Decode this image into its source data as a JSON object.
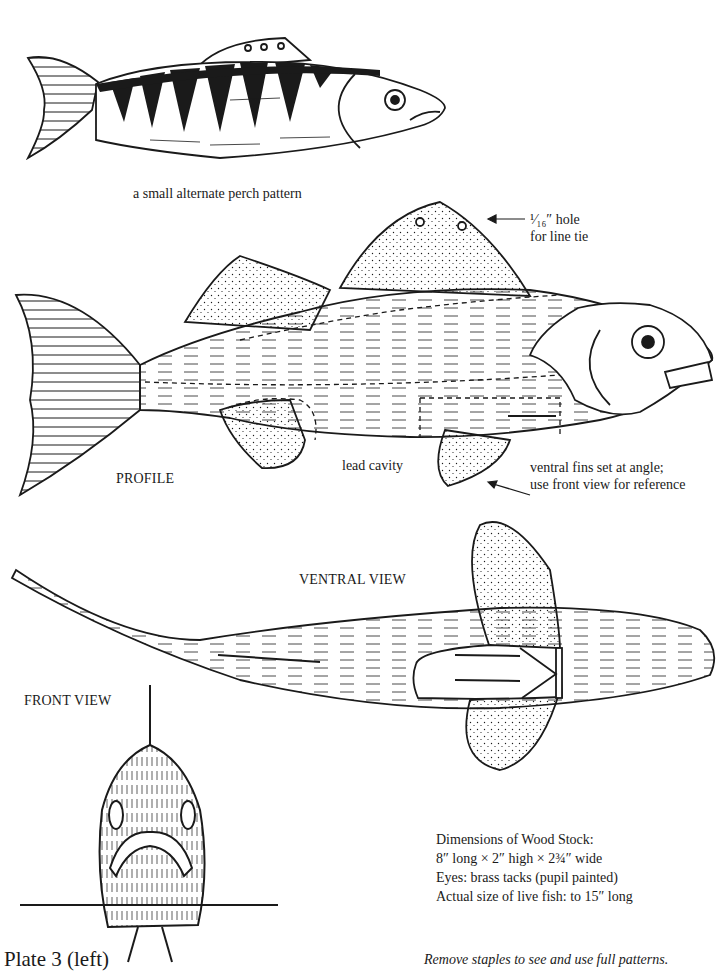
{
  "captions": {
    "alternate_pattern": "a small alternate perch pattern",
    "hole_line1": "¹⁄₁₆″ hole",
    "hole_line2": "for line tie",
    "profile": "PROFILE",
    "lead_cavity": "lead cavity",
    "ventral_fins_line1": "ventral fins set at angle;",
    "ventral_fins_line2": "use front view for reference",
    "ventral_view": "VENTRAL VIEW",
    "front_view": "FRONT VIEW"
  },
  "dimensions": {
    "heading": "Dimensions of Wood Stock:",
    "size": "8″ long × 2″ high × 2¾″ wide",
    "eyes": "Eyes: brass tacks (pupil painted)",
    "actual_size": "Actual size of live fish: to 15″ long"
  },
  "footer": {
    "plate_label": "Plate 3 (left)",
    "instruction": "Remove staples to see and use full patterns."
  },
  "illustrations": {
    "alternate_perch": "perch-pattern-illustration",
    "profile": "profile-view-illustration",
    "ventral": "ventral-view-illustration",
    "front": "front-view-illustration"
  },
  "colors": {
    "ink": "#1a1a1a",
    "paper": "#ffffff"
  }
}
